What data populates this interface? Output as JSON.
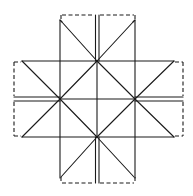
{
  "diagram": {
    "colors": {
      "line": "#1a1a1a",
      "background": "#ffffff"
    },
    "nodes": {
      "top": [
        97,
        61
      ],
      "left": [
        60,
        99
      ],
      "right": [
        135,
        99
      ],
      "bottom": [
        97,
        137
      ]
    },
    "flaps": [
      "top",
      "left",
      "right",
      "bottom"
    ]
  }
}
